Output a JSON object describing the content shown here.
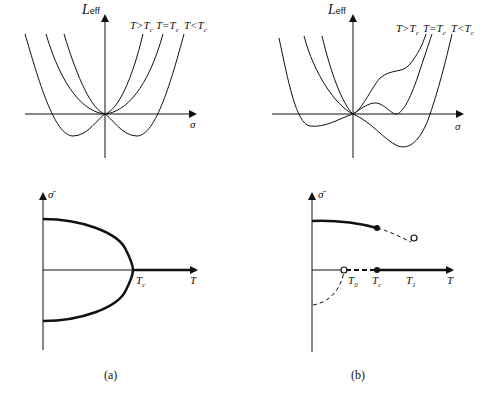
{
  "figure": {
    "panel_a": {
      "caption": "(a)",
      "top_plot": {
        "y_axis_label_main": "L",
        "y_axis_label_sub": "eff",
        "x_axis_label": "σ",
        "curve_labels": [
          "T>T",
          "T=T",
          "T<T"
        ],
        "curve_label_sub": "c",
        "curves": [
          {
            "name": "T>Tc",
            "shape": "single minimum at origin (narrow)"
          },
          {
            "name": "T=Tc",
            "shape": "flat quartic minimum at origin"
          },
          {
            "name": "T<Tc",
            "shape": "double-well, symmetric minima below axis"
          }
        ]
      },
      "bottom_plot": {
        "y_axis_label": "σ̄",
        "x_axis_label": "T",
        "tick_label_main": "T",
        "tick_label_sub": "c",
        "description": "Order parameter vanishes continuously at Tc (second-order transition); symmetric branches ±σ̄ merge at Tc"
      }
    },
    "panel_b": {
      "caption": "(b)",
      "top_plot": {
        "y_axis_label_main": "L",
        "y_axis_label_sub": "eff",
        "x_axis_label": "σ",
        "curve_labels": [
          "T>T",
          "T=T",
          "T<T"
        ],
        "curve_label_sub": "c",
        "curves": [
          {
            "name": "T>Tc",
            "shape": "minimum at origin with inflection shoulder"
          },
          {
            "name": "T=Tc",
            "shape": "two degenerate minima, at origin and at positive σ"
          },
          {
            "name": "T<Tc",
            "shape": "global minimum at positive σ below axis"
          }
        ]
      },
      "bottom_plot": {
        "y_axis_label": "σ̄",
        "x_axis_label": "T",
        "tick_labels": [
          {
            "main": "T",
            "sub": "0"
          },
          {
            "main": "T",
            "sub": "c"
          },
          {
            "main": "T",
            "sub": "1"
          }
        ],
        "description": "First-order transition: σ̄ jumps discontinuously at Tc; dashed metastable branches end at T0 and T1 (open circles)"
      }
    }
  }
}
